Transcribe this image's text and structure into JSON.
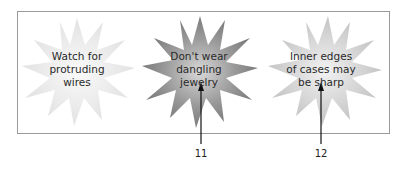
{
  "diagram": {
    "callouts": [
      {
        "text": "Watch for\nprotruding\nwires",
        "shade": "light"
      },
      {
        "text": "Don't wear\ndangling\njewelry",
        "shade": "dark",
        "number": "11"
      },
      {
        "text": "Inner edges\nof cases may\nbe sharp",
        "shade": "medium",
        "number": "12"
      }
    ],
    "colors": {
      "light": "#e6e6e6",
      "dark": "#8c8c8c",
      "medium": "#c8c8c8",
      "border": "#9a9a9a",
      "arrow": "#111111"
    }
  }
}
